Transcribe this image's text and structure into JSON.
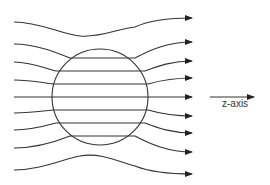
{
  "diagram": {
    "axis_label": "z-axis",
    "colors": {
      "line": "#333333",
      "background": "#ffffff"
    },
    "sphere": {
      "cx": 100,
      "cy": 97,
      "r": 48
    },
    "field_line_count": 9
  }
}
